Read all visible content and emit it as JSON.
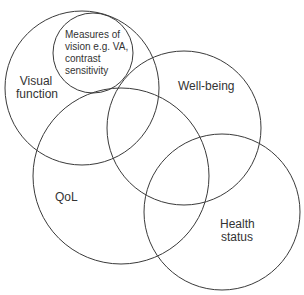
{
  "diagram": {
    "type": "venn",
    "stroke_color": "#3a3a3a",
    "background": "#ffffff",
    "circles": [
      {
        "id": "visual-function",
        "cx": 82,
        "cy": 88,
        "r": 77
      },
      {
        "id": "measures-of-vision",
        "cx": 93,
        "cy": 53,
        "r": 40
      },
      {
        "id": "well-being",
        "cx": 184,
        "cy": 128,
        "r": 77
      },
      {
        "id": "qol",
        "cx": 121,
        "cy": 176,
        "r": 88
      },
      {
        "id": "health-status",
        "cx": 222,
        "cy": 212,
        "r": 78
      }
    ],
    "labels": {
      "measures_line1": "Measures of",
      "measures_line2": "vision e.g. VA,",
      "measures_line3": "contrast",
      "measures_line4": "sensitivity",
      "visual_line1": "Visual",
      "visual_line2": "function",
      "well_being": "Well-being",
      "qol": "QoL",
      "health_line1": "Health",
      "health_line2": "status"
    }
  }
}
